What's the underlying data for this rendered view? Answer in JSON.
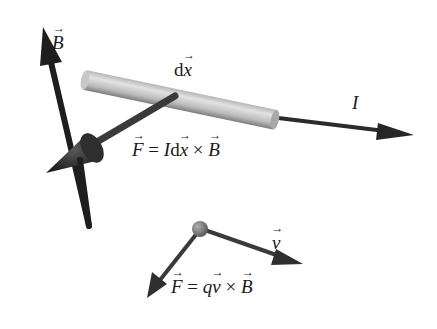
{
  "diagram": {
    "labels": {
      "B": "B",
      "dx_d": "d",
      "dx_x": "x",
      "I": "I",
      "force_wire_F": "F",
      "force_wire_eq": " = ",
      "force_wire_I": "I",
      "force_wire_d": "d",
      "force_wire_x": "x",
      "force_wire_times": " × ",
      "force_wire_B": "B",
      "v": "v",
      "force_charge_F": "F",
      "force_charge_eq": " = ",
      "force_charge_q": "q",
      "force_charge_v": "v",
      "force_charge_times": " × ",
      "force_charge_B": "B"
    },
    "colors": {
      "arrow_dark": "#262626",
      "arrow_mid": "#3c3c3c",
      "rod_light": "#d8d8d8",
      "rod_dark": "#8a8a8a",
      "particle": "#6e6e6e"
    }
  }
}
